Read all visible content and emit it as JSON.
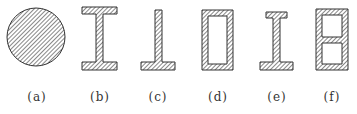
{
  "figure": {
    "colors": {
      "stroke": "#333333",
      "hatch": "#555555",
      "background": "#ffffff"
    },
    "panels": [
      {
        "id": "a",
        "label": "(a)",
        "shape": "solid circle",
        "label_x": 37
      },
      {
        "id": "b",
        "label": "(b)",
        "shape": "I-section (equal flanges)",
        "label_x": 100
      },
      {
        "id": "c",
        "label": "(c)",
        "shape": "inverted T-section",
        "label_x": 158
      },
      {
        "id": "d",
        "label": "(d)",
        "shape": "hollow rectangular box",
        "label_x": 218
      },
      {
        "id": "e",
        "label": "(e)",
        "shape": "I-section (unequal flanges)",
        "label_x": 277
      },
      {
        "id": "f",
        "label": "(f)",
        "shape": "double-cell box section",
        "label_x": 332
      }
    ]
  }
}
